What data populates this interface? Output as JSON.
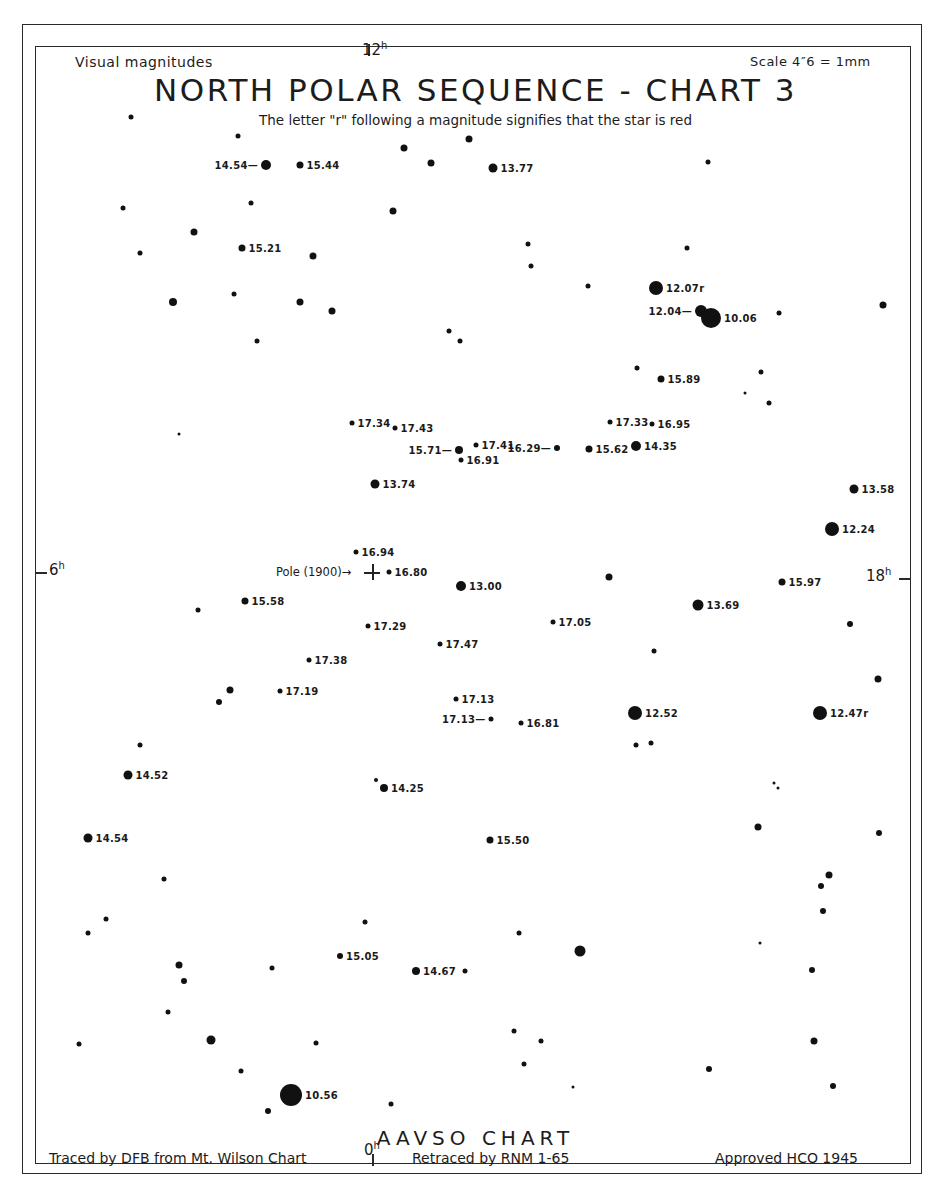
{
  "chart": {
    "corner_left": "Visual magnitudes",
    "corner_right": "Scale 4″6 = 1mm",
    "title": "NORTH POLAR SEQUENCE - CHART 3",
    "subtitle": "The letter \"r\" following a magnitude signifies that the star is red",
    "hours": {
      "top": "12",
      "left": "6",
      "right": "18",
      "bottom": "0",
      "unit": "h"
    },
    "pole": {
      "label": "Pole (1900)→",
      "x": 372,
      "y": 572
    },
    "footer": {
      "center": "AAVSO CHART",
      "traced": "Traced by DFB from Mt. Wilson Chart",
      "retraced": "Retraced by RNM 1-65",
      "approved": "Approved HCO 1945"
    }
  },
  "stars": [
    {
      "x": 266,
      "y": 165,
      "r": 5,
      "label": "14.54—",
      "side": "left"
    },
    {
      "x": 300,
      "y": 165,
      "r": 3.5,
      "label": "15.44"
    },
    {
      "x": 493,
      "y": 168,
      "r": 4.5,
      "label": "13.77"
    },
    {
      "x": 242,
      "y": 248,
      "r": 3.5,
      "label": "15.21"
    },
    {
      "x": 656,
      "y": 288,
      "r": 7,
      "label": "12.07r"
    },
    {
      "x": 701,
      "y": 311,
      "r": 6,
      "label": "12.04—",
      "side": "left"
    },
    {
      "x": 711,
      "y": 318,
      "r": 10,
      "label": "10.06"
    },
    {
      "x": 661,
      "y": 379,
      "r": 3.5,
      "label": "15.89"
    },
    {
      "x": 352,
      "y": 423,
      "r": 2.5,
      "label": "17.34"
    },
    {
      "x": 395,
      "y": 428,
      "r": 2.5,
      "label": "17.43"
    },
    {
      "x": 610,
      "y": 422,
      "r": 2.5,
      "label": "17.33"
    },
    {
      "x": 652,
      "y": 424,
      "r": 2.5,
      "label": "16.95"
    },
    {
      "x": 459,
      "y": 450,
      "r": 4,
      "label": "15.71—",
      "side": "left"
    },
    {
      "x": 476,
      "y": 445,
      "r": 2.5,
      "label": "17.41"
    },
    {
      "x": 461,
      "y": 460,
      "r": 2.5,
      "label": "16.91"
    },
    {
      "x": 557,
      "y": 448,
      "r": 3,
      "label": "16.29—",
      "side": "left"
    },
    {
      "x": 589,
      "y": 449,
      "r": 3.5,
      "label": "15.62"
    },
    {
      "x": 636,
      "y": 446,
      "r": 5,
      "label": "14.35"
    },
    {
      "x": 375,
      "y": 484,
      "r": 4.5,
      "label": "13.74"
    },
    {
      "x": 854,
      "y": 489,
      "r": 4.5,
      "label": "13.58"
    },
    {
      "x": 832,
      "y": 529,
      "r": 7,
      "label": "12.24"
    },
    {
      "x": 356,
      "y": 552,
      "r": 2.5,
      "label": "16.94"
    },
    {
      "x": 389,
      "y": 572,
      "r": 2.5,
      "label": "16.80"
    },
    {
      "x": 461,
      "y": 586,
      "r": 5,
      "label": "13.00"
    },
    {
      "x": 782,
      "y": 582,
      "r": 3.5,
      "label": "15.97"
    },
    {
      "x": 245,
      "y": 601,
      "r": 3.5,
      "label": "15.58"
    },
    {
      "x": 698,
      "y": 605,
      "r": 5.5,
      "label": "13.69"
    },
    {
      "x": 368,
      "y": 626,
      "r": 2.5,
      "label": "17.29"
    },
    {
      "x": 553,
      "y": 622,
      "r": 2.5,
      "label": "17.05"
    },
    {
      "x": 440,
      "y": 644,
      "r": 2.5,
      "label": "17.47"
    },
    {
      "x": 309,
      "y": 660,
      "r": 2.5,
      "label": "17.38"
    },
    {
      "x": 280,
      "y": 691,
      "r": 2.5,
      "label": "17.19"
    },
    {
      "x": 456,
      "y": 699,
      "r": 2.5,
      "label": "17.13"
    },
    {
      "x": 491,
      "y": 719,
      "r": 2.5,
      "label": "17.13—",
      "side": "left"
    },
    {
      "x": 521,
      "y": 723,
      "r": 2.5,
      "label": "16.81"
    },
    {
      "x": 635,
      "y": 713,
      "r": 7,
      "label": "12.52"
    },
    {
      "x": 820,
      "y": 713,
      "r": 7,
      "label": "12.47r"
    },
    {
      "x": 128,
      "y": 775,
      "r": 4.5,
      "label": "14.52"
    },
    {
      "x": 384,
      "y": 788,
      "r": 4,
      "label": "14.25"
    },
    {
      "x": 88,
      "y": 838,
      "r": 4.5,
      "label": "14.54"
    },
    {
      "x": 490,
      "y": 840,
      "r": 3.5,
      "label": "15.50"
    },
    {
      "x": 340,
      "y": 956,
      "r": 3,
      "label": "15.05"
    },
    {
      "x": 416,
      "y": 971,
      "r": 4,
      "label": "14.67"
    },
    {
      "x": 291,
      "y": 1095,
      "r": 11,
      "label": "10.56"
    },
    {
      "x": 131,
      "y": 117,
      "r": 2.5
    },
    {
      "x": 238,
      "y": 136,
      "r": 2.5
    },
    {
      "x": 404,
      "y": 148,
      "r": 3.5
    },
    {
      "x": 469,
      "y": 139,
      "r": 3.5
    },
    {
      "x": 431,
      "y": 163,
      "r": 3.5
    },
    {
      "x": 708,
      "y": 162,
      "r": 2.5
    },
    {
      "x": 123,
      "y": 208,
      "r": 2.5
    },
    {
      "x": 251,
      "y": 203,
      "r": 2.5
    },
    {
      "x": 393,
      "y": 211,
      "r": 3.5
    },
    {
      "x": 194,
      "y": 232,
      "r": 3.5
    },
    {
      "x": 140,
      "y": 253,
      "r": 2.5
    },
    {
      "x": 313,
      "y": 256,
      "r": 3.5
    },
    {
      "x": 528,
      "y": 244,
      "r": 2.5
    },
    {
      "x": 687,
      "y": 248,
      "r": 2.5
    },
    {
      "x": 531,
      "y": 266,
      "r": 2.5
    },
    {
      "x": 588,
      "y": 286,
      "r": 2.5
    },
    {
      "x": 173,
      "y": 302,
      "r": 4
    },
    {
      "x": 234,
      "y": 294,
      "r": 2.5
    },
    {
      "x": 300,
      "y": 302,
      "r": 3.5
    },
    {
      "x": 332,
      "y": 311,
      "r": 3.5
    },
    {
      "x": 883,
      "y": 305,
      "r": 3.5
    },
    {
      "x": 779,
      "y": 313,
      "r": 2.5
    },
    {
      "x": 449,
      "y": 331,
      "r": 2.5
    },
    {
      "x": 460,
      "y": 341,
      "r": 2.5
    },
    {
      "x": 257,
      "y": 341,
      "r": 2.5
    },
    {
      "x": 637,
      "y": 368,
      "r": 2.5
    },
    {
      "x": 761,
      "y": 372,
      "r": 2.5
    },
    {
      "x": 745,
      "y": 393,
      "r": 1.5
    },
    {
      "x": 769,
      "y": 403,
      "r": 2.5
    },
    {
      "x": 179,
      "y": 434,
      "r": 1.5
    },
    {
      "x": 609,
      "y": 577,
      "r": 3.5
    },
    {
      "x": 198,
      "y": 610,
      "r": 2.5
    },
    {
      "x": 850,
      "y": 624,
      "r": 3
    },
    {
      "x": 654,
      "y": 651,
      "r": 2.5
    },
    {
      "x": 878,
      "y": 679,
      "r": 3.5
    },
    {
      "x": 230,
      "y": 690,
      "r": 3.5
    },
    {
      "x": 219,
      "y": 702,
      "r": 3
    },
    {
      "x": 140,
      "y": 745,
      "r": 2.5
    },
    {
      "x": 636,
      "y": 745,
      "r": 2.5
    },
    {
      "x": 651,
      "y": 743,
      "r": 2.5
    },
    {
      "x": 376,
      "y": 780,
      "r": 2
    },
    {
      "x": 774,
      "y": 783,
      "r": 1.5
    },
    {
      "x": 778,
      "y": 788,
      "r": 1.5
    },
    {
      "x": 758,
      "y": 827,
      "r": 3.5
    },
    {
      "x": 879,
      "y": 833,
      "r": 3
    },
    {
      "x": 164,
      "y": 879,
      "r": 2.5
    },
    {
      "x": 829,
      "y": 875,
      "r": 3.5
    },
    {
      "x": 821,
      "y": 886,
      "r": 3
    },
    {
      "x": 823,
      "y": 911,
      "r": 3
    },
    {
      "x": 106,
      "y": 919,
      "r": 2.5
    },
    {
      "x": 88,
      "y": 933,
      "r": 2.5
    },
    {
      "x": 365,
      "y": 922,
      "r": 2.5
    },
    {
      "x": 519,
      "y": 933,
      "r": 2.5
    },
    {
      "x": 760,
      "y": 943,
      "r": 1.5
    },
    {
      "x": 580,
      "y": 951,
      "r": 5.5
    },
    {
      "x": 179,
      "y": 965,
      "r": 3.5
    },
    {
      "x": 184,
      "y": 981,
      "r": 3
    },
    {
      "x": 272,
      "y": 968,
      "r": 2.5
    },
    {
      "x": 465,
      "y": 971,
      "r": 2.5
    },
    {
      "x": 812,
      "y": 970,
      "r": 3
    },
    {
      "x": 168,
      "y": 1012,
      "r": 2.5
    },
    {
      "x": 79,
      "y": 1044,
      "r": 2.5
    },
    {
      "x": 211,
      "y": 1040,
      "r": 4.5
    },
    {
      "x": 316,
      "y": 1043,
      "r": 2.5
    },
    {
      "x": 514,
      "y": 1031,
      "r": 2.5
    },
    {
      "x": 541,
      "y": 1041,
      "r": 2.5
    },
    {
      "x": 814,
      "y": 1041,
      "r": 3.5
    },
    {
      "x": 524,
      "y": 1064,
      "r": 2.5
    },
    {
      "x": 241,
      "y": 1071,
      "r": 2.5
    },
    {
      "x": 709,
      "y": 1069,
      "r": 3
    },
    {
      "x": 573,
      "y": 1087,
      "r": 1.5
    },
    {
      "x": 833,
      "y": 1086,
      "r": 3
    },
    {
      "x": 268,
      "y": 1111,
      "r": 3
    },
    {
      "x": 391,
      "y": 1104,
      "r": 2.5
    }
  ]
}
